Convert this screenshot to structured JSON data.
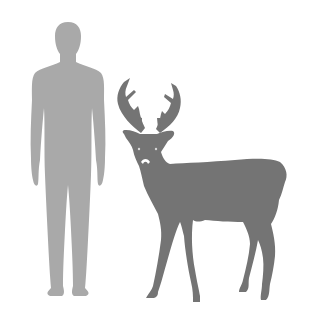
{
  "figure": {
    "type": "size-comparison",
    "subjects": [
      {
        "name": "human",
        "color": "#a9a9a9"
      },
      {
        "name": "deer",
        "color": "#747474"
      }
    ],
    "background": "#ffffff"
  }
}
